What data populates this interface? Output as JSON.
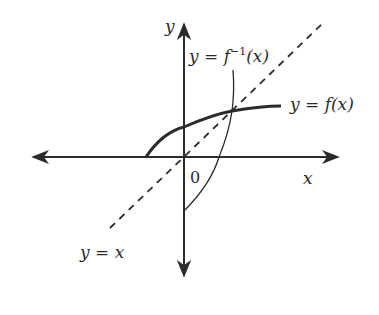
{
  "diagram": {
    "title": "",
    "labels": {
      "y_axis": "y",
      "x_axis": "x",
      "origin": "0",
      "f_inverse": "y = f",
      "f_inverse_sup": "−1",
      "f_inverse_tail": "(x)",
      "f": "y = f(x)",
      "identity": "y = x"
    },
    "colors": {
      "stroke": "#2b2b2b",
      "background": "#ffffff"
    },
    "elements": {
      "x_axis": {
        "from": [
          31,
          157
        ],
        "to": [
          340,
          157
        ],
        "arrows": "both"
      },
      "y_axis": {
        "from": [
          184,
          278
        ],
        "to": [
          184,
          22
        ],
        "arrows": "both"
      },
      "identity_line": {
        "from": [
          110,
          228
        ],
        "to": [
          322,
          24
        ],
        "style": "dashed"
      },
      "f_curve": {
        "points": [
          [
            146,
            157
          ],
          [
            184,
            127
          ],
          [
            232,
            111
          ],
          [
            281,
            106
          ]
        ],
        "style": "thick"
      },
      "f_inverse_curve": {
        "points": [
          [
            184,
            211
          ],
          [
            219,
            157
          ],
          [
            232,
            111
          ],
          [
            233,
            70
          ]
        ],
        "style": "thin"
      }
    }
  }
}
